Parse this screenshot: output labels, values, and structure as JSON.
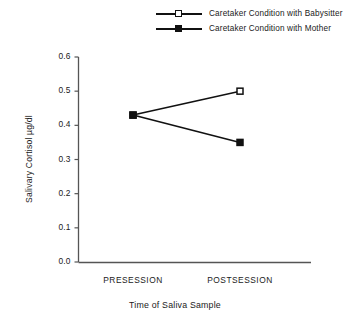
{
  "chart_data": {
    "type": "line",
    "title": "",
    "xlabel": "Time of Saliva Sample",
    "ylabel": "Salivary Cortisol µg/dl",
    "categories": [
      "PRESESSION",
      "POSTSESSION"
    ],
    "ylim": [
      0.0,
      0.6
    ],
    "yticks": [
      "0.0",
      "0.1",
      "0.2",
      "0.3",
      "0.4",
      "0.5",
      "0.6"
    ],
    "ytick_values": [
      0.0,
      0.1,
      0.2,
      0.3,
      0.4,
      0.5,
      0.6
    ],
    "grid": false,
    "legend_position": "top-center",
    "series": [
      {
        "name": "Caretaker Condition with Babysitter",
        "marker": "open-square",
        "values": [
          0.43,
          0.5
        ]
      },
      {
        "name": "Caretaker Condition with Mother",
        "marker": "filled-square",
        "values": [
          0.43,
          0.35
        ]
      }
    ]
  },
  "legend": {
    "items": [
      {
        "label": "Caretaker Condition with Babysitter",
        "marker": "open-square"
      },
      {
        "label": "Caretaker Condition with Mother",
        "marker": "filled-square"
      }
    ]
  },
  "axes": {
    "y_title": "Salivary Cortisol µg/dl",
    "x_title": "Time of Saliva Sample",
    "y_ticks": [
      "0.6",
      "0.5",
      "0.4",
      "0.3",
      "0.2",
      "0.1",
      "0.0"
    ],
    "x_categories": [
      "PRESESSION",
      "POSTSESSION"
    ]
  },
  "colors": {
    "line": "#111111",
    "axis": "#555555",
    "background": "#ffffff",
    "text": "#1a1a1a"
  }
}
